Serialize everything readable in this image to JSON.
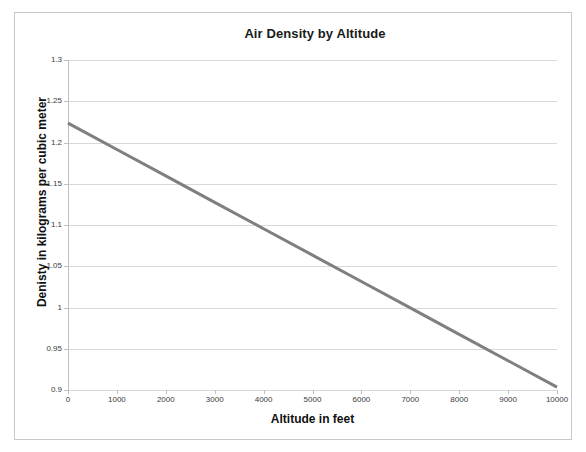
{
  "chart_data": {
    "type": "line",
    "title": "Air Density by Altitude",
    "xlabel": "Altitude in feet",
    "ylabel": "Denisty in kilograms per cubic meter",
    "xlim": [
      0,
      10000
    ],
    "ylim": [
      0.9,
      1.3
    ],
    "x_ticks": [
      "0",
      "1000",
      "2000",
      "3000",
      "4000",
      "5000",
      "6000",
      "7000",
      "8000",
      "9000",
      "10000"
    ],
    "y_ticks": [
      "0.9",
      "0.95",
      "1",
      "1.05",
      "1.1",
      "1.15",
      "1.2",
      "1.25",
      "1.3"
    ],
    "x_tick_values": [
      0,
      1000,
      2000,
      3000,
      4000,
      5000,
      6000,
      7000,
      8000,
      9000,
      10000
    ],
    "y_tick_values": [
      0.9,
      0.95,
      1,
      1.05,
      1.1,
      1.15,
      1.2,
      1.25,
      1.3
    ],
    "grid": "horizontal",
    "legend": "none",
    "series": [
      {
        "name": "Air density",
        "color": "#7f7f7f",
        "line_width": 3,
        "x": [
          0,
          1000,
          2000,
          3000,
          4000,
          5000,
          6000,
          7000,
          8000,
          9000,
          10000
        ],
        "values": [
          1.2235,
          1.1915,
          1.1595,
          1.1275,
          1.0955,
          1.0635,
          1.0315,
          0.9995,
          0.9675,
          0.9355,
          0.9035
        ]
      }
    ]
  },
  "chart": {
    "title": "Air Density by Altitude",
    "x_axis_title": "Altitude in feet",
    "y_axis_title": "Denisty in kilograms per cubic meter",
    "colors": {
      "series_line": "#7f7f7f",
      "gridline": "#d9d9d9",
      "axis": "#bfbfbf",
      "frame_border": "#c9c9c9",
      "text": "#1a1a1a",
      "background": "#ffffff"
    }
  }
}
